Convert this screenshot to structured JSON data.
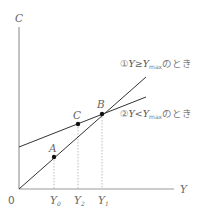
{
  "axes": {
    "y_label": "C",
    "x_label": "Y",
    "origin_label": "0"
  },
  "points": {
    "A": "A",
    "B": "B",
    "C": "C"
  },
  "x_ticks": {
    "y0": {
      "main": "Y",
      "sub": "0"
    },
    "y2": {
      "main": "Y",
      "sub": "2"
    },
    "y1": {
      "main": "Y",
      "sub": "1"
    }
  },
  "annotations": {
    "line1": {
      "prefix": "①",
      "cond_left": "Y≥Y",
      "sub": "max",
      "suffix": "のとき"
    },
    "line2": {
      "prefix": "②",
      "cond_left": "Y<Y",
      "sub": "max",
      "suffix": "のとき"
    }
  },
  "colors": {
    "axis": "#888888",
    "line": "#333333",
    "dotted": "#aaaaaa",
    "point": "#111111"
  }
}
